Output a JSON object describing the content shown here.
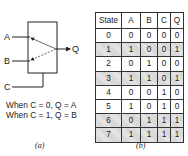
{
  "panel_a": {
    "inputs": [
      "A",
      "B",
      "C"
    ],
    "output": "Q",
    "rules": [
      "When C = 0, Q = A",
      "When C = 1, Q = B"
    ],
    "caption": "(a)"
  },
  "panel_b": {
    "headers": [
      "State",
      "A",
      "B",
      "C",
      "Q"
    ],
    "rows": [
      {
        "cells": [
          "0",
          "0",
          "0",
          "0",
          "0"
        ],
        "shaded": false
      },
      {
        "cells": [
          "1",
          "1",
          "0",
          "0",
          "1"
        ],
        "shaded": true
      },
      {
        "cells": [
          "2",
          "0",
          "1",
          "0",
          "0"
        ],
        "shaded": false
      },
      {
        "cells": [
          "3",
          "1",
          "1",
          "0",
          "1"
        ],
        "shaded": true
      },
      {
        "cells": [
          "4",
          "0",
          "0",
          "1",
          "0"
        ],
        "shaded": false
      },
      {
        "cells": [
          "5",
          "1",
          "0",
          "1",
          "0"
        ],
        "shaded": false
      },
      {
        "cells": [
          "6",
          "0",
          "1",
          "1",
          "1"
        ],
        "shaded": true
      },
      {
        "cells": [
          "7",
          "1",
          "1",
          "1",
          "1"
        ],
        "shaded": true
      }
    ],
    "caption": "(b)"
  }
}
